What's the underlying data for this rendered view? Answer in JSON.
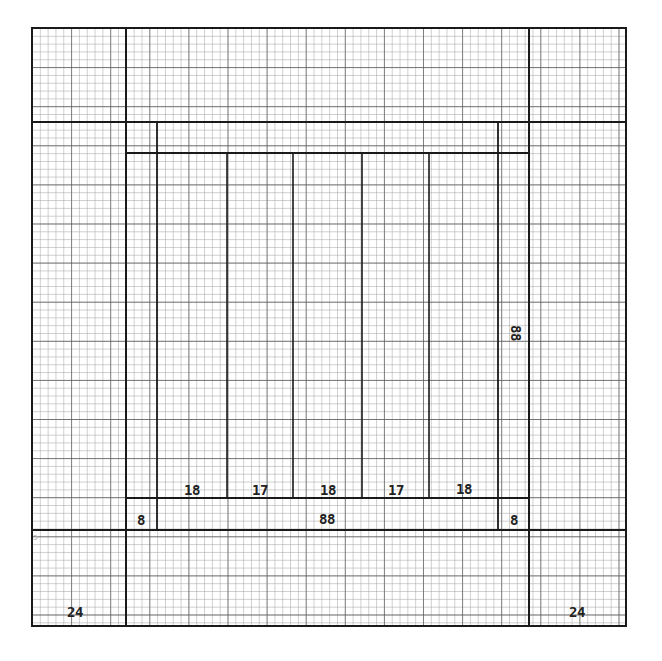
{
  "diagram": {
    "type": "quilt-block-graph-paper-plan",
    "grid": {
      "minor_cell_px": 7.82,
      "major_every": 5,
      "minor_color": "#9a9a9a",
      "major_color": "#555555",
      "line_color": "#1a1a1a"
    },
    "labels": {
      "strip_1": "18",
      "strip_2": "17",
      "strip_3": "18",
      "strip_4": "17",
      "strip_5": "18",
      "bottom_left_corner_square": "8",
      "bottom_band_width": "88",
      "bottom_right_corner_square": "8",
      "right_band_height": "88",
      "outer_bottom_left": "24",
      "outer_bottom_right": "24"
    }
  }
}
